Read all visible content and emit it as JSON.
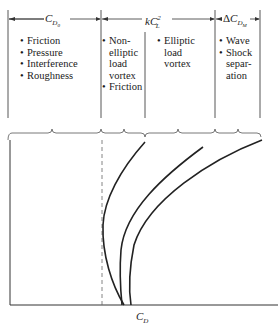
{
  "diagram": {
    "type": "drag polar component breakdown",
    "columns": [
      {
        "id": "cd0",
        "header": {
          "main": "C",
          "sub": "D",
          "subsub": "0",
          "prefix": "",
          "sup": ""
        },
        "items": [
          "Friction",
          "Pressure",
          "Interference",
          "Roughness"
        ]
      },
      {
        "id": "kcl2",
        "header": {
          "main": "kC",
          "sub": "L",
          "sup": "2",
          "prefix": ""
        },
        "subcolumns": [
          {
            "items": [
              "Non-",
              "elliptic",
              "load",
              "vortex"
            ],
            "items2": [
              "Friction"
            ]
          },
          {
            "items": [
              "Elliptic",
              "load",
              "vortex"
            ]
          }
        ]
      },
      {
        "id": "dcdm",
        "header": {
          "prefix": "Δ",
          "main": "C",
          "sub": "D",
          "subsub": "M"
        },
        "items": [
          "Wave",
          "Shock",
          "separ-",
          "ation"
        ]
      }
    ],
    "x_axis_label": {
      "main": "C",
      "sub": "D"
    }
  },
  "labels": {
    "col1_bullets": [
      "Friction",
      "Pressure",
      "Interference",
      "Roughness"
    ],
    "col2a_bullet1": "Non-",
    "col2a_cont": [
      "elliptic",
      "load",
      "vortex"
    ],
    "col2a_bullet2": "Friction",
    "col2b_bullet1": "Elliptic",
    "col2b_cont": [
      "load",
      "vortex"
    ],
    "col3_bullet1": "Wave",
    "col3_bullet2": "Shock",
    "col3_cont": [
      "separ-",
      "ation"
    ],
    "hdr1_main": "C",
    "hdr1_sub": "D",
    "hdr1_subsub": "0",
    "hdr2_main": "kC",
    "hdr2_sub": "L",
    "hdr2_sup": "2",
    "hdr3_prefix": "Δ",
    "hdr3_main": "C",
    "hdr3_sub": "D",
    "hdr3_subsub": "M",
    "axis_main": "C",
    "axis_sub": "D"
  },
  "colors": {
    "line": "#333333",
    "text": "#1a1a1a",
    "background": "#ffffff"
  }
}
